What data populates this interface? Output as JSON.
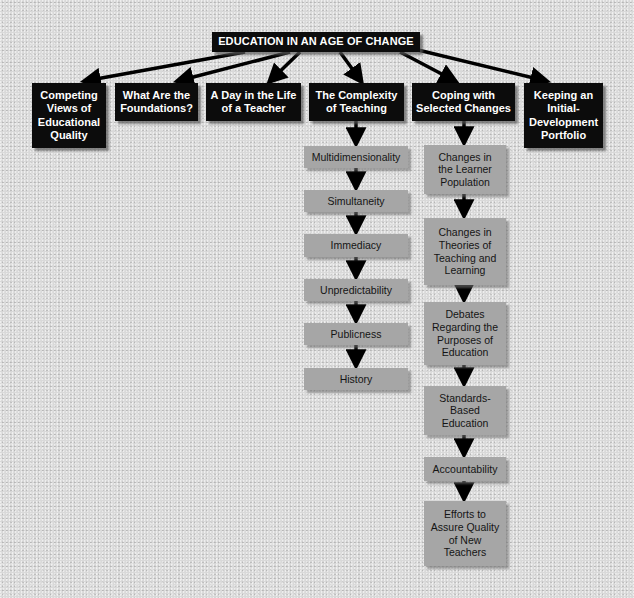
{
  "title": "EDUCATION IN AN AGE OF CHANGE",
  "topics": [
    {
      "label": "Competing Views of Educational Quality"
    },
    {
      "label": "What Are the Foundations?"
    },
    {
      "label": "A Day in the Life of a Teacher"
    },
    {
      "label": "The Complexity of Teaching"
    },
    {
      "label": "Coping with Selected Changes"
    },
    {
      "label": "Keeping an Initial-Development Portfolio"
    }
  ],
  "complexity_items": [
    {
      "label": "Multidimensionality"
    },
    {
      "label": "Simultaneity"
    },
    {
      "label": "Immediacy"
    },
    {
      "label": "Unpredictability"
    },
    {
      "label": "Publicness"
    },
    {
      "label": "History"
    }
  ],
  "changes_items": [
    {
      "label": "Changes in the Learner Population"
    },
    {
      "label": "Changes in Theories of Teaching and Learning"
    },
    {
      "label": "Debates Regarding the Purposes of Education"
    },
    {
      "label": "Standards-Based Education"
    },
    {
      "label": "Accountability"
    },
    {
      "label": "Efforts to Assure Quality of New Teachers"
    }
  ],
  "colors": {
    "dark_box": "#0c0c0c",
    "light_box": "#a6a6a6",
    "arrow": "#000000",
    "background": "#d9d9d9"
  }
}
